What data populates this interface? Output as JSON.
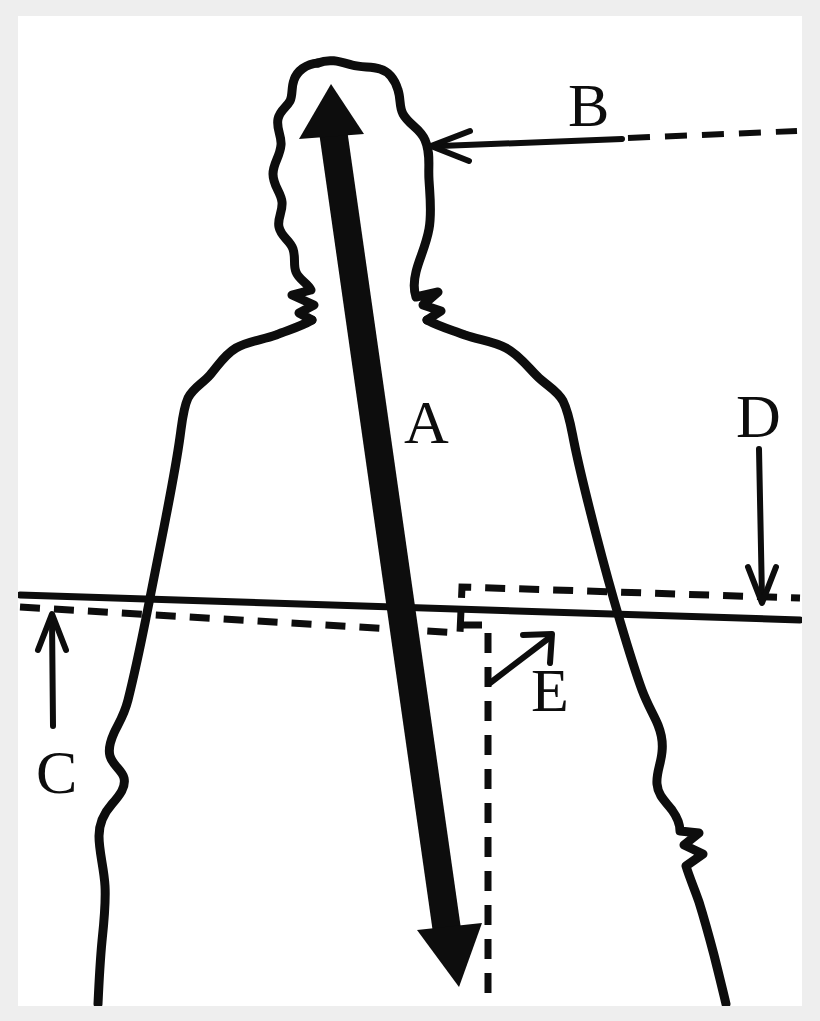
{
  "figure": {
    "background_color": "#eeeeee",
    "page_color": "#ffffff",
    "ink_color": "#0d0d0d",
    "page": {
      "x": 18,
      "y": 16,
      "width": 784,
      "height": 990
    }
  },
  "labels": {
    "a": "A",
    "b": "B",
    "c": "C",
    "d": "D",
    "e": "E"
  },
  "annotations": [
    {
      "id": "A",
      "label": "A",
      "marker": "double-headed-thick-arrow",
      "description": "Thick double headed arrow running from top of head down through torso",
      "label_position": {
        "x": 404,
        "y": 443
      },
      "line": {
        "x1": 330,
        "y1": 86,
        "x2": 461,
        "y2": 981
      }
    },
    {
      "id": "B",
      "label": "B",
      "marker": "left-arrow-with-dashed-leader",
      "description": "Arrow pointing left toward the side of the head",
      "label_position": {
        "x": 568,
        "y": 126
      },
      "arrow_tip": {
        "x": 431,
        "y": 146
      },
      "solid_to": {
        "x": 622,
        "y": 139
      },
      "dashed_to": {
        "x": 797,
        "y": 132
      }
    },
    {
      "id": "C",
      "label": "C",
      "marker": "up-arrow",
      "description": "Arrow pointing up toward the solid horizontal reference line",
      "label_position": {
        "x": 36,
        "y": 793
      },
      "arrow_tip": {
        "x": 52,
        "y": 614
      },
      "arrow_tail": {
        "x": 52,
        "y": 726
      }
    },
    {
      "id": "D",
      "label": "D",
      "marker": "down-arrow",
      "description": "Arrow pointing down toward the solid horizontal reference line",
      "label_position": {
        "x": 736,
        "y": 437
      },
      "arrow_tip": {
        "x": 762,
        "y": 603
      },
      "arrow_tail": {
        "x": 760,
        "y": 449
      }
    },
    {
      "id": "E",
      "label": "E",
      "marker": "diagonal-up-right-arrow",
      "description": "Arrow pointing up and right toward the dashed step corner",
      "label_position": {
        "x": 531,
        "y": 711
      },
      "arrow_tip": {
        "x": 551,
        "y": 636
      },
      "arrow_tail": {
        "x": 490,
        "y": 682
      }
    }
  ],
  "reference_lines": {
    "solid_horizontal": {
      "style": "solid",
      "x1": 20,
      "y1": 595,
      "x2": 800,
      "y2": 620
    },
    "dashed_horizontal": {
      "style": "dashed",
      "points": "20,607 462,633 462,587 800,598"
    },
    "dashed_vertical": {
      "style": "dashed",
      "x1": 488,
      "y1": 624,
      "x2": 488,
      "y2": 1004
    }
  },
  "silhouette": {
    "name": "human-head-and-torso-outline",
    "stroke_width": 9,
    "fill": "none"
  }
}
